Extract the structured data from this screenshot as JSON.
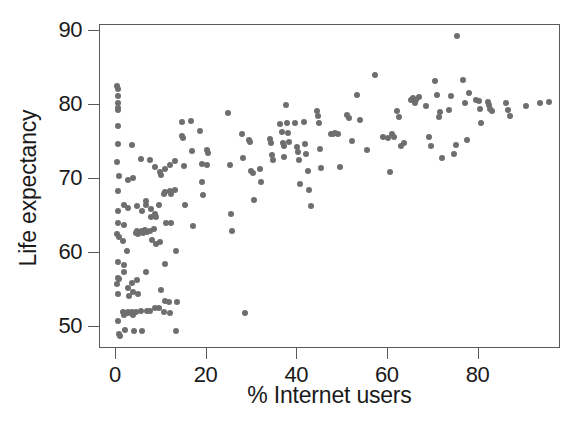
{
  "chart_data": {
    "type": "scatter",
    "title": "",
    "xlabel": "% Internet users",
    "ylabel": "Life expectancy",
    "xlim": [
      -3.5,
      98.2
    ],
    "ylim": [
      47.0,
      90.8
    ],
    "xticks": [
      0,
      20,
      40,
      60,
      80
    ],
    "xtick_labels": [
      "0",
      "20",
      "40",
      "60",
      "80"
    ],
    "yticks": [
      50,
      60,
      70,
      80,
      90
    ],
    "ytick_labels": [
      "50",
      "60",
      "70",
      "80",
      "90"
    ],
    "grid": false,
    "legend": null,
    "marker_color": "#6e6e6e",
    "marker_size_px": 6,
    "frame_color": "#5a5a5a",
    "n_points": 181,
    "points": [
      [
        0.3,
        82.5
      ],
      [
        0.5,
        82.1
      ],
      [
        0.4,
        81.2
      ],
      [
        0.5,
        80.3
      ],
      [
        0.4,
        79.6
      ],
      [
        0.4,
        79.3
      ],
      [
        0.5,
        77.1
      ],
      [
        0.4,
        74.7
      ],
      [
        0.3,
        72.3
      ],
      [
        0.6,
        70.4
      ],
      [
        0.4,
        68.3
      ],
      [
        0.5,
        65.6
      ],
      [
        0.5,
        64.0
      ],
      [
        0.3,
        62.6
      ],
      [
        0.6,
        62.2
      ],
      [
        0.4,
        58.7
      ],
      [
        0.4,
        56.6
      ],
      [
        0.6,
        56.5
      ],
      [
        0.3,
        55.8
      ],
      [
        0.5,
        54.5
      ],
      [
        0.4,
        50.8
      ],
      [
        0.8,
        49.0
      ],
      [
        0.9,
        48.7
      ],
      [
        1.7,
        66.5
      ],
      [
        1.8,
        63.8
      ],
      [
        1.6,
        61.6
      ],
      [
        1.8,
        58.3
      ],
      [
        1.9,
        57.4
      ],
      [
        1.6,
        52.0
      ],
      [
        1.8,
        51.6
      ],
      [
        2.0,
        49.6
      ],
      [
        2.6,
        69.9
      ],
      [
        2.7,
        66.0
      ],
      [
        2.5,
        60.3
      ],
      [
        2.6,
        55.3
      ],
      [
        2.8,
        54.2
      ],
      [
        2.7,
        52.0
      ],
      [
        2.6,
        51.8
      ],
      [
        3.6,
        74.6
      ],
      [
        3.7,
        70.1
      ],
      [
        3.5,
        55.9
      ],
      [
        3.8,
        54.7
      ],
      [
        3.6,
        52.0
      ],
      [
        3.7,
        51.6
      ],
      [
        3.9,
        49.5
      ],
      [
        4.6,
        66.3
      ],
      [
        4.7,
        62.9
      ],
      [
        4.5,
        62.7
      ],
      [
        4.9,
        62.6
      ],
      [
        4.6,
        56.3
      ],
      [
        4.8,
        54.5
      ],
      [
        4.4,
        52.0
      ],
      [
        5.6,
        72.7
      ],
      [
        5.7,
        65.6
      ],
      [
        5.8,
        63.0
      ],
      [
        5.5,
        62.8
      ],
      [
        5.9,
        62.7
      ],
      [
        5.6,
        52.1
      ],
      [
        5.8,
        49.5
      ],
      [
        6.6,
        67.0
      ],
      [
        6.7,
        66.4
      ],
      [
        6.5,
        63.1
      ],
      [
        6.8,
        62.8
      ],
      [
        6.6,
        57.4
      ],
      [
        6.9,
        52.2
      ],
      [
        7.6,
        72.5
      ],
      [
        7.7,
        65.9
      ],
      [
        7.8,
        64.8
      ],
      [
        7.5,
        63.0
      ],
      [
        7.9,
        61.7
      ],
      [
        7.6,
        52.2
      ],
      [
        8.6,
        71.6
      ],
      [
        8.7,
        65.2
      ],
      [
        8.8,
        64.8
      ],
      [
        8.5,
        63.2
      ],
      [
        8.9,
        61.2
      ],
      [
        8.6,
        52.5
      ],
      [
        9.8,
        70.9
      ],
      [
        9.9,
        70.5
      ],
      [
        9.5,
        66.4
      ],
      [
        9.7,
        61.4
      ],
      [
        9.9,
        55.0
      ],
      [
        9.6,
        52.6
      ],
      [
        10.8,
        71.3
      ],
      [
        10.9,
        68.2
      ],
      [
        10.7,
        67.9
      ],
      [
        11.0,
        64.1
      ],
      [
        10.8,
        58.5
      ],
      [
        10.9,
        53.5
      ],
      [
        10.7,
        52.0
      ],
      [
        11.9,
        71.9
      ],
      [
        12.0,
        68.4
      ],
      [
        12.1,
        67.9
      ],
      [
        12.2,
        64.0
      ],
      [
        11.8,
        53.4
      ],
      [
        12.0,
        51.9
      ],
      [
        13.0,
        72.4
      ],
      [
        13.1,
        68.5
      ],
      [
        13.3,
        60.2
      ],
      [
        13.5,
        53.3
      ],
      [
        13.2,
        49.5
      ],
      [
        14.5,
        77.7
      ],
      [
        14.7,
        75.8
      ],
      [
        14.9,
        75.5
      ],
      [
        15.1,
        71.7
      ],
      [
        15.3,
        66.5
      ],
      [
        16.5,
        77.8
      ],
      [
        16.8,
        73.8
      ],
      [
        17.0,
        63.6
      ],
      [
        18.6,
        76.5
      ],
      [
        18.9,
        72.0
      ],
      [
        19.1,
        69.6
      ],
      [
        19.3,
        67.8
      ],
      [
        20.0,
        73.9
      ],
      [
        20.3,
        73.5
      ],
      [
        20.2,
        71.9
      ],
      [
        24.8,
        78.9
      ],
      [
        25.1,
        71.9
      ],
      [
        25.4,
        65.3
      ],
      [
        25.6,
        62.9
      ],
      [
        27.8,
        76.0
      ],
      [
        28.1,
        72.8
      ],
      [
        28.4,
        51.9
      ],
      [
        29.3,
        75.3
      ],
      [
        29.6,
        75.0
      ],
      [
        29.9,
        71.1
      ],
      [
        30.2,
        70.8
      ],
      [
        30.5,
        67.2
      ],
      [
        31.8,
        71.4
      ],
      [
        32.1,
        69.6
      ],
      [
        33.9,
        75.4
      ],
      [
        34.2,
        74.8
      ],
      [
        34.4,
        73.2
      ],
      [
        34.6,
        72.5
      ],
      [
        36.3,
        77.4
      ],
      [
        36.6,
        76.3
      ],
      [
        36.8,
        74.9
      ],
      [
        37.0,
        74.5
      ],
      [
        37.2,
        72.9
      ],
      [
        37.5,
        80.0
      ],
      [
        37.8,
        77.5
      ],
      [
        38.0,
        76.2
      ],
      [
        38.3,
        75.0
      ],
      [
        39.6,
        77.6
      ],
      [
        39.9,
        74.3
      ],
      [
        40.1,
        73.6
      ],
      [
        40.3,
        72.6
      ],
      [
        40.6,
        69.3
      ],
      [
        41.5,
        77.7
      ],
      [
        41.8,
        74.7
      ],
      [
        42.0,
        73.4
      ],
      [
        42.3,
        71.1
      ],
      [
        42.5,
        68.5
      ],
      [
        43.0,
        66.3
      ],
      [
        44.3,
        79.2
      ],
      [
        44.6,
        78.5
      ],
      [
        44.8,
        77.5
      ],
      [
        45.1,
        74.1
      ],
      [
        45.3,
        71.5
      ],
      [
        47.4,
        76.0
      ],
      [
        47.9,
        76.1
      ],
      [
        48.4,
        76.2
      ],
      [
        49.0,
        76.0
      ],
      [
        49.5,
        71.6
      ],
      [
        51.0,
        78.7
      ],
      [
        51.5,
        78.2
      ],
      [
        52.0,
        75.1
      ],
      [
        53.3,
        81.4
      ],
      [
        53.8,
        78.0
      ],
      [
        55.5,
        73.9
      ],
      [
        57.2,
        84.1
      ],
      [
        59.0,
        75.7
      ],
      [
        60.0,
        75.5
      ],
      [
        60.5,
        70.9
      ],
      [
        61.0,
        76.0
      ],
      [
        61.3,
        75.6
      ],
      [
        62.0,
        79.2
      ],
      [
        62.5,
        78.4
      ],
      [
        63.0,
        74.4
      ],
      [
        63.5,
        74.9
      ],
      [
        65.0,
        80.7
      ],
      [
        65.5,
        80.9
      ],
      [
        66.0,
        80.3
      ],
      [
        66.3,
        80.6
      ],
      [
        66.8,
        81.1
      ],
      [
        68.5,
        79.9
      ],
      [
        69.0,
        75.7
      ],
      [
        69.5,
        74.5
      ],
      [
        70.5,
        83.2
      ],
      [
        70.8,
        81.4
      ],
      [
        71.2,
        78.4
      ],
      [
        71.5,
        79.0
      ],
      [
        72.0,
        72.8
      ],
      [
        73.5,
        79.3
      ],
      [
        74.0,
        81.2
      ],
      [
        74.5,
        73.3
      ],
      [
        75.0,
        74.6
      ],
      [
        75.3,
        89.3
      ],
      [
        76.5,
        83.4
      ],
      [
        77.0,
        80.2
      ],
      [
        77.5,
        75.2
      ],
      [
        78.0,
        81.6
      ],
      [
        79.5,
        80.7
      ],
      [
        80.0,
        80.5
      ],
      [
        80.3,
        79.5
      ],
      [
        80.6,
        77.6
      ],
      [
        82.0,
        80.4
      ],
      [
        82.3,
        80.0
      ],
      [
        82.6,
        79.5
      ],
      [
        83.0,
        79.2
      ],
      [
        86.0,
        80.3
      ],
      [
        86.5,
        79.3
      ],
      [
        87.0,
        78.5
      ],
      [
        90.5,
        79.9
      ],
      [
        93.5,
        80.3
      ],
      [
        95.5,
        80.4
      ]
    ]
  }
}
